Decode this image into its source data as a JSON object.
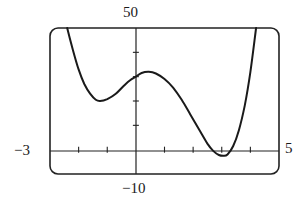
{
  "chart_data": {
    "type": "line",
    "title": "",
    "xlabel": "",
    "ylabel": "",
    "xlim": [
      -3,
      5
    ],
    "ylim": [
      -10,
      50
    ],
    "x_tick_step": 1,
    "y_tick_step": 10,
    "grid": false,
    "legend": null,
    "window_labels": {
      "ymax": "50",
      "ymin": "-10",
      "xmin": "-3",
      "xmax": "5"
    },
    "series": [
      {
        "name": "f(x)",
        "x": [
          -2.4,
          -2.2,
          -2.0,
          -1.8,
          -1.6,
          -1.4,
          -1.25,
          -1.0,
          -0.7,
          -0.4,
          -0.2,
          0.0,
          0.2,
          0.45,
          0.7,
          1.0,
          1.3,
          1.6,
          1.9,
          2.2,
          2.5,
          2.7,
          2.9,
          3.05,
          3.2,
          3.4,
          3.6,
          3.8,
          4.0,
          4.2
        ],
        "y": [
          50,
          41,
          33,
          27,
          23,
          20.5,
          20,
          20.8,
          23,
          26.5,
          28.5,
          30,
          31.5,
          32,
          31.3,
          29,
          25.5,
          20.5,
          14.5,
          8.5,
          2.5,
          -0.5,
          -2.2,
          -2.5,
          -2,
          1.5,
          8,
          18,
          32,
          50
        ]
      }
    ]
  }
}
